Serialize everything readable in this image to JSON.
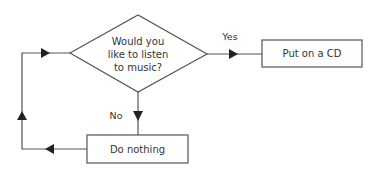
{
  "diagram": {
    "type": "flowchart",
    "nodes": {
      "decision": {
        "shape": "diamond",
        "lines": [
          "Would you",
          "like to listen",
          "to music?"
        ]
      },
      "yes_action": {
        "shape": "rectangle",
        "text": "Put on a CD"
      },
      "no_action": {
        "shape": "rectangle",
        "text": "Do nothing"
      }
    },
    "edges": {
      "yes": {
        "from": "decision",
        "to": "yes_action",
        "label": "Yes"
      },
      "no": {
        "from": "decision",
        "to": "no_action",
        "label": "No"
      },
      "loop": {
        "from": "no_action",
        "to": "decision",
        "label": ""
      }
    },
    "colors": {
      "stroke": "#555555",
      "arrow": "#222222",
      "text": "#333333",
      "background": "#ffffff"
    }
  }
}
